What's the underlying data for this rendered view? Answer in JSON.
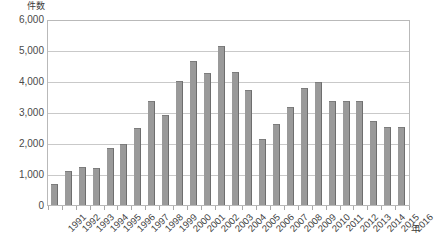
{
  "chart_data": {
    "type": "bar",
    "title": "",
    "xlabel": "年",
    "ylabel": "件数",
    "ylim": [
      0,
      6000
    ],
    "ytick_step": 1000,
    "grid": true,
    "legend": false,
    "bar_color": "#9a9a9a",
    "bar_edge_color": "#6e6e6e",
    "frame_color": "#b9b9b9",
    "gridline_color": "#c9c9c9",
    "categories": [
      "1991",
      "1992",
      "1993",
      "1994",
      "1995",
      "1996",
      "1997",
      "1998",
      "1999",
      "2000",
      "2001",
      "2002",
      "2003",
      "2004",
      "2005",
      "2006",
      "2007",
      "2008",
      "2009",
      "2010",
      "2011",
      "2012",
      "2013",
      "2014",
      "2015",
      "2016"
    ],
    "values": [
      700,
      1100,
      1250,
      1200,
      1850,
      2000,
      2500,
      3400,
      2950,
      4050,
      4700,
      4300,
      5200,
      4350,
      3750,
      2150,
      2650,
      3200,
      3800,
      4000,
      3400,
      3400,
      3400,
      2750,
      2550,
      2550
    ],
    "ytick_labels": [
      "6,000",
      "5,000",
      "4,000",
      "3,000",
      "2,000",
      "1,000",
      "0"
    ],
    "ytick_values": [
      6000,
      5000,
      4000,
      3000,
      2000,
      1000,
      0
    ]
  }
}
